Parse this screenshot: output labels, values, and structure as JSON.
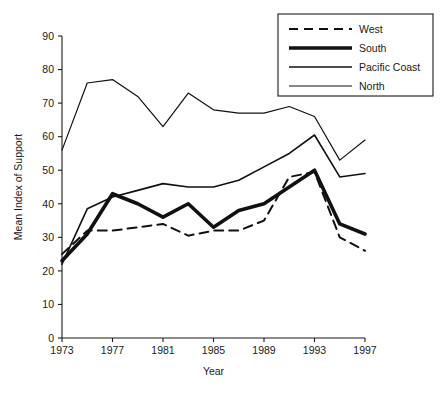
{
  "chart_data": {
    "type": "line",
    "title": "",
    "subtitle": "",
    "xlabel": "Year",
    "ylabel": "Mean Index of Support",
    "xlim": [
      1973,
      1997
    ],
    "ylim": [
      0,
      90
    ],
    "grid": false,
    "legend_position": "top-right",
    "x": [
      1973,
      1975,
      1977,
      1979,
      1981,
      1983,
      1985,
      1987,
      1989,
      1991,
      1993,
      1995,
      1997
    ],
    "xticks": [
      1973,
      1977,
      1981,
      1985,
      1989,
      1993,
      1997
    ],
    "xtick_labels": [
      "1973",
      "1977",
      "1981",
      "1985",
      "1989",
      "1993",
      "1997"
    ],
    "yticks": [
      0,
      10,
      20,
      30,
      40,
      50,
      60,
      70,
      80,
      90
    ],
    "ytick_labels": [
      "0",
      "10",
      "20",
      "30",
      "40",
      "50",
      "60",
      "70",
      "80",
      "90"
    ],
    "series": [
      {
        "name": "West",
        "style": "dashed",
        "width": 2.0,
        "color": "#111111",
        "values": [
          25,
          32,
          32,
          33,
          34,
          30.5,
          32,
          32,
          35,
          48,
          49.5,
          30,
          26
        ]
      },
      {
        "name": "South",
        "style": "solid",
        "width": 3.6,
        "color": "#111111",
        "values": [
          23,
          31,
          43,
          40,
          36,
          40,
          33,
          38,
          40,
          45,
          50,
          34,
          31
        ]
      },
      {
        "name": "Pacific Coast",
        "style": "solid",
        "width": 1.6,
        "color": "#111111",
        "values": [
          22,
          38.5,
          42,
          44,
          46,
          45,
          45,
          47,
          51,
          55,
          60.5,
          48,
          49
        ]
      },
      {
        "name": "North",
        "style": "solid",
        "width": 1.2,
        "color": "#111111",
        "values": [
          56,
          76,
          77,
          72,
          63,
          73,
          68,
          67,
          67,
          69,
          66,
          53,
          59
        ]
      }
    ]
  },
  "legend": {
    "entries": [
      {
        "label": "West"
      },
      {
        "label": "South"
      },
      {
        "label": "Pacific Coast"
      },
      {
        "label": "North"
      }
    ]
  }
}
